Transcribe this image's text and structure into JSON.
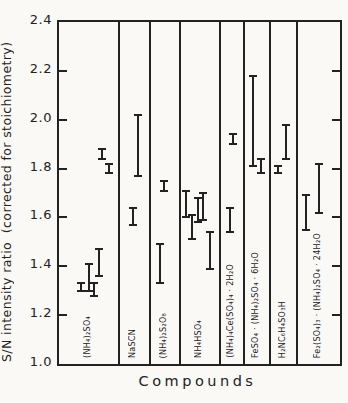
{
  "figure": {
    "y_axis_title": "S/N intensity ratio  (corrected for stoichiometry)",
    "x_axis_title": "Compounds",
    "ink_color": "#222222",
    "paper_color": "#faf9f6"
  },
  "chart_data": {
    "type": "error-bar-ranges",
    "title": "",
    "xlabel": "Compounds",
    "ylabel": "S/N intensity ratio (corrected for stoichiometry)",
    "ylim": [
      1.0,
      2.4
    ],
    "yticks": [
      2.4,
      2.2,
      2.0,
      1.8,
      1.6,
      1.4,
      1.2,
      1.0
    ],
    "grid": false,
    "legend": false,
    "panel_bounds_frac": [
      0,
      0.213,
      0.324,
      0.431,
      0.573,
      0.658,
      0.751,
      0.847,
      1.0
    ],
    "panels": [
      {
        "compound": "(NH₄)₂SO₄",
        "bars": [
          {
            "x_frac": 0.37,
            "low": 1.3,
            "high": 1.33
          },
          {
            "x_frac": 0.5,
            "low": 1.3,
            "high": 1.41
          },
          {
            "x_frac": 0.58,
            "low": 1.28,
            "high": 1.33
          },
          {
            "x_frac": 0.67,
            "low": 1.36,
            "high": 1.47
          },
          {
            "x_frac": 0.72,
            "low": 1.84,
            "high": 1.88
          },
          {
            "x_frac": 0.83,
            "low": 1.78,
            "high": 1.82
          }
        ]
      },
      {
        "compound": "NaSCN",
        "bars": [
          {
            "x_frac": 0.46,
            "low": 1.57,
            "high": 1.64
          },
          {
            "x_frac": 0.6,
            "low": 1.77,
            "high": 2.02
          }
        ]
      },
      {
        "compound": "(NH₄)₂S₂O₈",
        "bars": [
          {
            "x_frac": 0.34,
            "low": 1.33,
            "high": 1.49
          },
          {
            "x_frac": 0.46,
            "low": 1.71,
            "high": 1.75
          }
        ]
      },
      {
        "compound": "NH₄HSO₄",
        "bars": [
          {
            "x_frac": 0.16,
            "low": 1.6,
            "high": 1.71
          },
          {
            "x_frac": 0.31,
            "low": 1.51,
            "high": 1.61
          },
          {
            "x_frac": 0.44,
            "low": 1.58,
            "high": 1.68
          },
          {
            "x_frac": 0.57,
            "low": 1.59,
            "high": 1.7
          },
          {
            "x_frac": 0.74,
            "low": 1.39,
            "high": 1.54
          }
        ]
      },
      {
        "compound": "(NH₄)₄Ce(SO₄)₄ · 2H₂O",
        "bars": [
          {
            "x_frac": 0.42,
            "low": 1.54,
            "high": 1.64
          },
          {
            "x_frac": 0.56,
            "low": 1.9,
            "high": 1.94
          }
        ]
      },
      {
        "compound": "FeSO₄ · (NH₄)₂SO₄ · 6H₂O",
        "bars": [
          {
            "x_frac": 0.36,
            "low": 1.81,
            "high": 2.18
          },
          {
            "x_frac": 0.64,
            "low": 1.78,
            "high": 1.84
          }
        ]
      },
      {
        "compound": "H₂NC₆H₄SO₃H",
        "bars": [
          {
            "x_frac": 0.31,
            "low": 1.78,
            "high": 1.81
          },
          {
            "x_frac": 0.59,
            "low": 1.84,
            "high": 1.98
          }
        ]
      },
      {
        "compound": "Fe₂(SO₄)₃ · (NH₄)₂SO₄ · 24H₂O",
        "bars": [
          {
            "x_frac": 0.2,
            "low": 1.55,
            "high": 1.69
          },
          {
            "x_frac": 0.5,
            "low": 1.62,
            "high": 1.82
          }
        ]
      }
    ]
  }
}
